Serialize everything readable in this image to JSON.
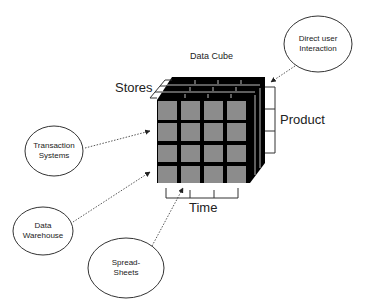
{
  "diagram": {
    "title": "Data Cube",
    "dimensions": {
      "stores": "Stores",
      "product": "Product",
      "time": "Time"
    },
    "sources": [
      {
        "id": "direct-user",
        "line1": "Direct user",
        "line2": "Interaction"
      },
      {
        "id": "transaction",
        "line1": "Transaction",
        "line2": "Systems"
      },
      {
        "id": "warehouse",
        "line1": "Data",
        "line2": "Warehouse"
      },
      {
        "id": "spreadsheets",
        "line1": "Spread-",
        "line2": "Sheets"
      }
    ],
    "cube": {
      "rows": 4,
      "cols": 4,
      "depth": 4,
      "face_color": "#8c8c8c",
      "edge_color": "#000000"
    }
  }
}
